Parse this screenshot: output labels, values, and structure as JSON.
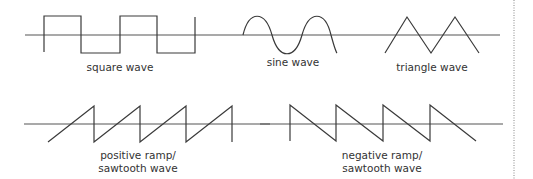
{
  "colors": {
    "stroke": "#3a3a3a",
    "axis": "#555555",
    "text": "#333333",
    "divider": "#888888"
  },
  "waves": {
    "square": {
      "label": "square wave"
    },
    "sine": {
      "label": "sine wave"
    },
    "triangle": {
      "label": "triangle wave"
    },
    "positive_ramp": {
      "label_line1": "positive ramp/",
      "label_line2": "sawtooth wave"
    },
    "negative_ramp": {
      "label_line1": "negative ramp/",
      "label_line2": "sawtooth wave"
    }
  }
}
